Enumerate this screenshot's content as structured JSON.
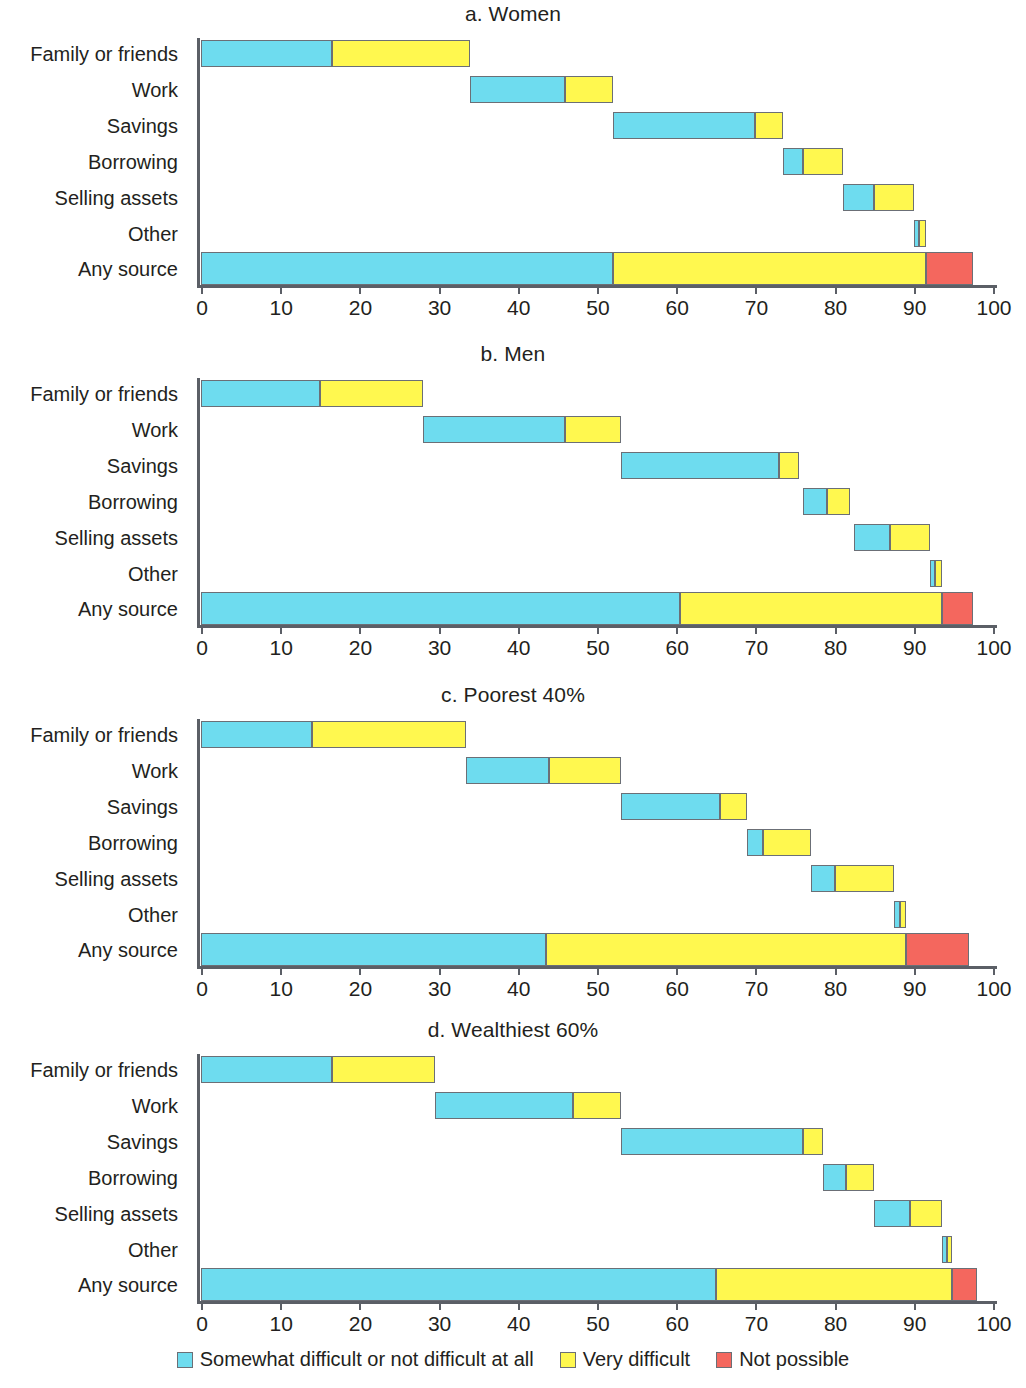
{
  "chart_data": {
    "type": "bar",
    "orientation": "horizontal",
    "stacked": true,
    "title": "",
    "xlabel": "",
    "ylabel": "",
    "xlim": [
      0,
      100
    ],
    "xticks": [
      0,
      10,
      20,
      30,
      40,
      50,
      60,
      70,
      80,
      90,
      100
    ],
    "xticklabels": [
      "0",
      "10",
      "20",
      "30",
      "40",
      "50",
      "60",
      "70",
      "80",
      "90",
      "100"
    ],
    "grid": false,
    "legend_position": "bottom-center",
    "categories": [
      "Family or friends",
      "Work",
      "Savings",
      "Borrowing",
      "Selling assets",
      "Other",
      "Any source"
    ],
    "series": [
      {
        "name": "Somewhat difficult or not difficult at all",
        "color": "#6edcef"
      },
      {
        "name": "Very difficult",
        "color": "#fff84f"
      },
      {
        "name": "Not possible",
        "color": "#f4675e"
      }
    ],
    "note": "Waterfall-style stacked bars: each category segment begins where the previous category ended; values below are absolute start/end positions on the 0-100 axis.",
    "panels": [
      {
        "key": "a",
        "title": "a. Women",
        "bars": [
          {
            "category": "Family or friends",
            "segments": [
              {
                "series": "Somewhat difficult or not difficult at all",
                "start": 0,
                "end": 16.5
              },
              {
                "series": "Very difficult",
                "start": 16.5,
                "end": 34
              }
            ]
          },
          {
            "category": "Work",
            "segments": [
              {
                "series": "Somewhat difficult or not difficult at all",
                "start": 34,
                "end": 46
              },
              {
                "series": "Very difficult",
                "start": 46,
                "end": 52
              }
            ]
          },
          {
            "category": "Savings",
            "segments": [
              {
                "series": "Somewhat difficult or not difficult at all",
                "start": 52,
                "end": 70
              },
              {
                "series": "Very difficult",
                "start": 70,
                "end": 73.5
              }
            ]
          },
          {
            "category": "Borrowing",
            "segments": [
              {
                "series": "Somewhat difficult or not difficult at all",
                "start": 73.5,
                "end": 76
              },
              {
                "series": "Very difficult",
                "start": 76,
                "end": 81
              }
            ]
          },
          {
            "category": "Selling assets",
            "segments": [
              {
                "series": "Somewhat difficult or not difficult at all",
                "start": 81,
                "end": 85
              },
              {
                "series": "Very difficult",
                "start": 85,
                "end": 90
              }
            ]
          },
          {
            "category": "Other",
            "segments": [
              {
                "series": "Somewhat difficult or not difficult at all",
                "start": 90,
                "end": 90.7
              },
              {
                "series": "Very difficult",
                "start": 90.7,
                "end": 91.5
              }
            ]
          },
          {
            "category": "Any source",
            "segments": [
              {
                "series": "Somewhat difficult or not difficult at all",
                "start": 0,
                "end": 52
              },
              {
                "series": "Very difficult",
                "start": 52,
                "end": 91.5
              },
              {
                "series": "Not possible",
                "start": 91.5,
                "end": 97.5
              }
            ]
          }
        ]
      },
      {
        "key": "b",
        "title": "b. Men",
        "bars": [
          {
            "category": "Family or friends",
            "segments": [
              {
                "series": "Somewhat difficult or not difficult at all",
                "start": 0,
                "end": 15
              },
              {
                "series": "Very difficult",
                "start": 15,
                "end": 28
              }
            ]
          },
          {
            "category": "Work",
            "segments": [
              {
                "series": "Somewhat difficult or not difficult at all",
                "start": 28,
                "end": 46
              },
              {
                "series": "Very difficult",
                "start": 46,
                "end": 53
              }
            ]
          },
          {
            "category": "Savings",
            "segments": [
              {
                "series": "Somewhat difficult or not difficult at all",
                "start": 53,
                "end": 73
              },
              {
                "series": "Very difficult",
                "start": 73,
                "end": 75.5
              }
            ]
          },
          {
            "category": "Borrowing",
            "segments": [
              {
                "series": "Somewhat difficult or not difficult at all",
                "start": 76,
                "end": 79
              },
              {
                "series": "Very difficult",
                "start": 79,
                "end": 82
              }
            ]
          },
          {
            "category": "Selling assets",
            "segments": [
              {
                "series": "Somewhat difficult or not difficult at all",
                "start": 82.5,
                "end": 87
              },
              {
                "series": "Very difficult",
                "start": 87,
                "end": 92
              }
            ]
          },
          {
            "category": "Other",
            "segments": [
              {
                "series": "Somewhat difficult or not difficult at all",
                "start": 92,
                "end": 92.7
              },
              {
                "series": "Very difficult",
                "start": 92.7,
                "end": 93.5
              }
            ]
          },
          {
            "category": "Any source",
            "segments": [
              {
                "series": "Somewhat difficult or not difficult at all",
                "start": 0,
                "end": 60.5
              },
              {
                "series": "Very difficult",
                "start": 60.5,
                "end": 93.5
              },
              {
                "series": "Not possible",
                "start": 93.5,
                "end": 97.5
              }
            ]
          }
        ]
      },
      {
        "key": "c",
        "title": "c. Poorest 40%",
        "bars": [
          {
            "category": "Family or friends",
            "segments": [
              {
                "series": "Somewhat difficult or not difficult at all",
                "start": 0,
                "end": 14
              },
              {
                "series": "Very difficult",
                "start": 14,
                "end": 33.5
              }
            ]
          },
          {
            "category": "Work",
            "segments": [
              {
                "series": "Somewhat difficult or not difficult at all",
                "start": 33.5,
                "end": 44
              },
              {
                "series": "Very difficult",
                "start": 44,
                "end": 53
              }
            ]
          },
          {
            "category": "Savings",
            "segments": [
              {
                "series": "Somewhat difficult or not difficult at all",
                "start": 53,
                "end": 65.5
              },
              {
                "series": "Very difficult",
                "start": 65.5,
                "end": 69
              }
            ]
          },
          {
            "category": "Borrowing",
            "segments": [
              {
                "series": "Somewhat difficult or not difficult at all",
                "start": 69,
                "end": 71
              },
              {
                "series": "Very difficult",
                "start": 71,
                "end": 77
              }
            ]
          },
          {
            "category": "Selling assets",
            "segments": [
              {
                "series": "Somewhat difficult or not difficult at all",
                "start": 77,
                "end": 80
              },
              {
                "series": "Very difficult",
                "start": 80,
                "end": 87.5
              }
            ]
          },
          {
            "category": "Other",
            "segments": [
              {
                "series": "Somewhat difficult or not difficult at all",
                "start": 87.5,
                "end": 88.2
              },
              {
                "series": "Very difficult",
                "start": 88.2,
                "end": 89
              }
            ]
          },
          {
            "category": "Any source",
            "segments": [
              {
                "series": "Somewhat difficult or not difficult at all",
                "start": 0,
                "end": 43.5
              },
              {
                "series": "Very difficult",
                "start": 43.5,
                "end": 89
              },
              {
                "series": "Not possible",
                "start": 89,
                "end": 97
              }
            ]
          }
        ]
      },
      {
        "key": "d",
        "title": "d. Wealthiest 60%",
        "bars": [
          {
            "category": "Family or friends",
            "segments": [
              {
                "series": "Somewhat difficult or not difficult at all",
                "start": 0,
                "end": 16.5
              },
              {
                "series": "Very difficult",
                "start": 16.5,
                "end": 29.5
              }
            ]
          },
          {
            "category": "Work",
            "segments": [
              {
                "series": "Somewhat difficult or not difficult at all",
                "start": 29.5,
                "end": 47
              },
              {
                "series": "Very difficult",
                "start": 47,
                "end": 53
              }
            ]
          },
          {
            "category": "Savings",
            "segments": [
              {
                "series": "Somewhat difficult or not difficult at all",
                "start": 53,
                "end": 76
              },
              {
                "series": "Very difficult",
                "start": 76,
                "end": 78.5
              }
            ]
          },
          {
            "category": "Borrowing",
            "segments": [
              {
                "series": "Somewhat difficult or not difficult at all",
                "start": 78.5,
                "end": 81.5
              },
              {
                "series": "Very difficult",
                "start": 81.5,
                "end": 85
              }
            ]
          },
          {
            "category": "Selling assets",
            "segments": [
              {
                "series": "Somewhat difficult or not difficult at all",
                "start": 85,
                "end": 89.5
              },
              {
                "series": "Very difficult",
                "start": 89.5,
                "end": 93.5
              }
            ]
          },
          {
            "category": "Other",
            "segments": [
              {
                "series": "Somewhat difficult or not difficult at all",
                "start": 93.5,
                "end": 94.2
              },
              {
                "series": "Very difficult",
                "start": 94.2,
                "end": 94.8
              }
            ]
          },
          {
            "category": "Any source",
            "segments": [
              {
                "series": "Somewhat difficult or not difficult at all",
                "start": 0,
                "end": 65
              },
              {
                "series": "Very difficult",
                "start": 65,
                "end": 94.8
              },
              {
                "series": "Not possible",
                "start": 94.8,
                "end": 98
              }
            ]
          }
        ]
      }
    ]
  },
  "legend": {
    "items": [
      {
        "label": "Somewhat difficult or not difficult at all",
        "color": "#6edcef"
      },
      {
        "label": "Very difficult",
        "color": "#fff84f"
      },
      {
        "label": "Not possible",
        "color": "#f4675e"
      }
    ]
  }
}
